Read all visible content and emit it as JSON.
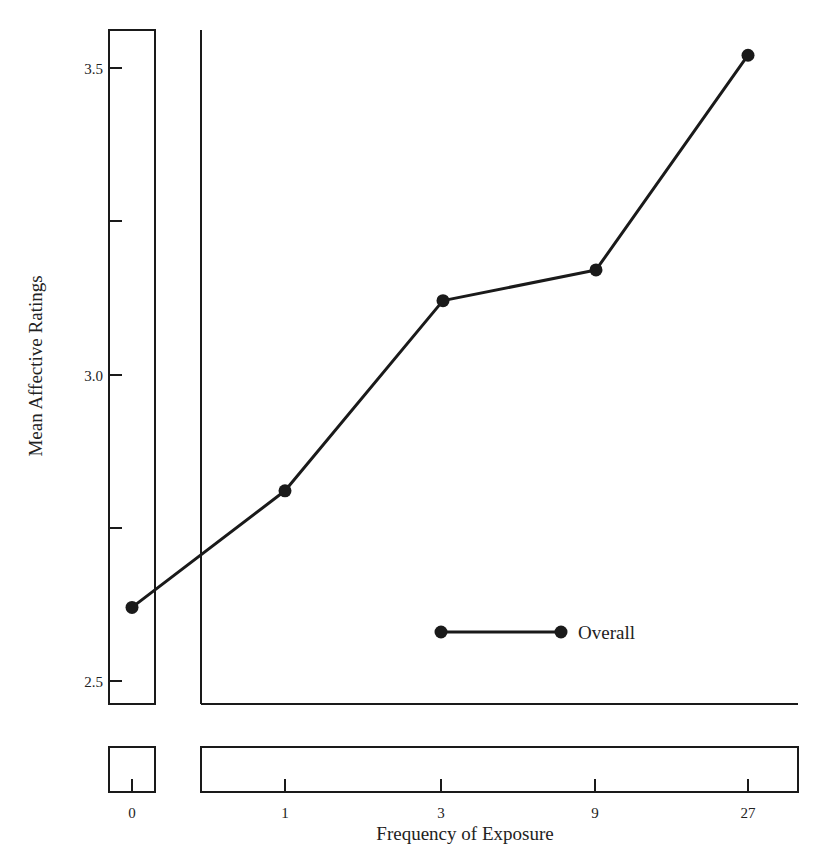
{
  "chart_data": {
    "type": "line",
    "title": "",
    "xlabel": "Frequency of Exposure",
    "ylabel": "Mean Affective Ratings",
    "categories": [
      "0",
      "1",
      "3",
      "9",
      "27"
    ],
    "series": [
      {
        "name": "Overall",
        "values": [
          2.62,
          2.81,
          3.12,
          3.17,
          3.52
        ],
        "color": "#1a1a1a",
        "marker": "filled-circle"
      }
    ],
    "ylim": [
      2.5,
      3.55
    ],
    "y_ticks": [
      2.5,
      2.75,
      3.0,
      3.25,
      3.5
    ],
    "y_tick_labels": [
      "2.5",
      "",
      "3.0",
      "",
      "3.5"
    ],
    "x_tick_labels": [
      "0",
      "1",
      "3",
      "9",
      "27"
    ],
    "x_axis_break": "between 0 and 1",
    "grid": false,
    "legend_position": "lower right inside plot"
  },
  "labels": {
    "y_axis_title": "Mean Affective Ratings",
    "x_axis_title": "Frequency of Exposure",
    "legend_entry": "Overall",
    "y_ticks": [
      "3.5",
      "3.0",
      "2.5"
    ],
    "x_ticks": [
      "0",
      "1",
      "3",
      "9",
      "27"
    ]
  }
}
